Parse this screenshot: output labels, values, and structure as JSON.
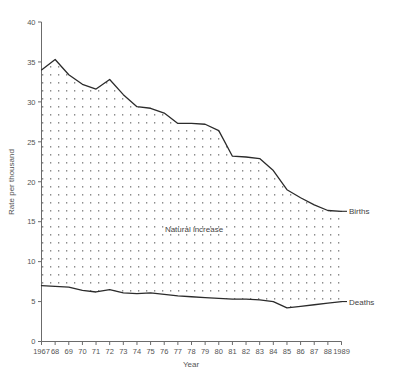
{
  "chart_data": {
    "type": "area",
    "title": "",
    "xlabel": "Year",
    "ylabel": "Rate per thousand",
    "ylim": [
      0,
      40
    ],
    "ytick_step": 5,
    "yticks": [
      0,
      5,
      10,
      15,
      20,
      25,
      30,
      35,
      40
    ],
    "grid": false,
    "legend_position": "inline-right",
    "x": [
      1967,
      1968,
      1969,
      1970,
      1971,
      1972,
      1973,
      1974,
      1975,
      1976,
      1977,
      1978,
      1979,
      1980,
      1981,
      1982,
      1983,
      1984,
      1985,
      1986,
      1987,
      1988,
      1989
    ],
    "categories": [
      "1967",
      "68",
      "69",
      "70",
      "71",
      "72",
      "73",
      "74",
      "75",
      "76",
      "77",
      "78",
      "79",
      "80",
      "81",
      "82",
      "83",
      "84",
      "85",
      "86",
      "87",
      "88",
      "1989"
    ],
    "series": [
      {
        "name": "Births",
        "values": [
          34.0,
          35.3,
          33.4,
          32.2,
          31.6,
          32.8,
          30.9,
          29.4,
          29.2,
          28.6,
          27.3,
          27.3,
          27.2,
          26.4,
          23.2,
          23.1,
          22.9,
          21.4,
          19.0,
          18.0,
          17.1,
          16.4,
          16.3
        ]
      },
      {
        "name": "Deaths",
        "values": [
          7.0,
          6.9,
          6.8,
          6.4,
          6.2,
          6.5,
          6.1,
          6.0,
          6.1,
          5.9,
          5.7,
          5.6,
          5.5,
          5.4,
          5.3,
          5.3,
          5.2,
          5.0,
          4.2,
          4.4,
          4.6,
          4.8,
          5.0
        ]
      }
    ],
    "area_label": "Natural increase",
    "area_fill": "dotted-pattern",
    "colors": {
      "line": "#2b2b2b",
      "axis": "#6b6b6b",
      "text": "#555555",
      "pattern_dot": "#8a8a8a",
      "background": "#ffffff"
    }
  },
  "axes": {
    "y_title": "Rate per thousand",
    "x_title": "Year",
    "y_tick_labels": [
      "0",
      "5",
      "10",
      "15",
      "20",
      "25",
      "30",
      "35",
      "40"
    ],
    "x_tick_labels": [
      "1967",
      "68",
      "69",
      "70",
      "71",
      "72",
      "73",
      "74",
      "75",
      "76",
      "77",
      "78",
      "79",
      "80",
      "81",
      "82",
      "83",
      "84",
      "85",
      "86",
      "87",
      "88",
      "1989"
    ]
  },
  "annotations": {
    "births_label": "Births",
    "deaths_label": "Deaths",
    "natural_increase_label": "Natural increase"
  }
}
